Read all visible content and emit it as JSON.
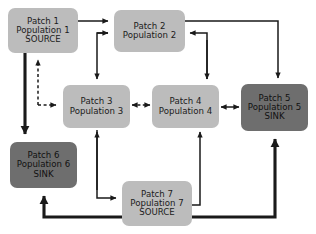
{
  "diagram": {
    "colors": {
      "source_and_neutral_fill": "#bcbcbc",
      "sink_fill": "#6e6e6e",
      "background": "#ffffff",
      "edge_color": "#1a1a1a",
      "text": "#1b1b1b"
    },
    "nodes": [
      {
        "id": "patch-1",
        "patch_label": "Patch 1",
        "population_label": "Population 1",
        "role_label": "SOURCE",
        "role": "source",
        "fill": "#bcbcbc",
        "x": 8,
        "y": 8,
        "w": 70,
        "h": 45
      },
      {
        "id": "patch-2",
        "patch_label": "Patch 2",
        "population_label": "Population 2",
        "role_label": "",
        "role": "neutral",
        "fill": "#bcbcbc",
        "x": 114,
        "y": 10,
        "w": 71,
        "h": 42
      },
      {
        "id": "patch-3",
        "patch_label": "Patch 3",
        "population_label": "Population 3",
        "role_label": "",
        "role": "neutral",
        "fill": "#bcbcbc",
        "x": 63,
        "y": 85,
        "w": 67,
        "h": 43
      },
      {
        "id": "patch-4",
        "patch_label": "Patch 4",
        "population_label": "Population 4",
        "role_label": "",
        "role": "neutral",
        "fill": "#bcbcbc",
        "x": 152,
        "y": 85,
        "w": 67,
        "h": 43
      },
      {
        "id": "patch-5",
        "patch_label": "Patch 5",
        "population_label": "Population 5",
        "role_label": "SINK",
        "role": "sink",
        "fill": "#6e6e6e",
        "x": 241,
        "y": 84,
        "w": 67,
        "h": 47
      },
      {
        "id": "patch-6",
        "patch_label": "Patch 6",
        "population_label": "Population 6",
        "role_label": "SINK",
        "role": "sink",
        "fill": "#6e6e6e",
        "x": 10,
        "y": 142,
        "w": 67,
        "h": 46
      },
      {
        "id": "patch-7",
        "patch_label": "Patch 7",
        "population_label": "Population 7",
        "role_label": "SOURCE",
        "role": "source",
        "fill": "#bcbcbc",
        "x": 122,
        "y": 181,
        "w": 70,
        "h": 45
      }
    ],
    "edges": [
      {
        "id": "e1",
        "from": "patch-1",
        "to": "patch-2",
        "style": "solid",
        "weight": "thin",
        "heads": "single"
      },
      {
        "id": "e2",
        "from": "patch-1",
        "to": "patch-6",
        "style": "solid",
        "weight": "thick",
        "heads": "single"
      },
      {
        "id": "e3",
        "from": "patch-6",
        "to": "patch-1",
        "style": "dashed",
        "weight": "thin",
        "heads": "single"
      },
      {
        "id": "e4",
        "from": "patch-6",
        "to": "patch-3",
        "style": "dashed",
        "weight": "thin",
        "heads": "single"
      },
      {
        "id": "e5",
        "from": "patch-2",
        "to": "patch-3",
        "style": "solid",
        "weight": "thin",
        "heads": "single"
      },
      {
        "id": "e6",
        "from": "patch-2",
        "to": "patch-5",
        "style": "solid",
        "weight": "thin",
        "heads": "single"
      },
      {
        "id": "e7",
        "from": "patch-4",
        "to": "patch-2",
        "style": "solid",
        "weight": "thin",
        "heads": "single"
      },
      {
        "id": "e8",
        "from": "patch-3",
        "to": "patch-4",
        "style": "dashed",
        "weight": "thin",
        "heads": "double"
      },
      {
        "id": "e9",
        "from": "patch-4",
        "to": "patch-5",
        "style": "solid",
        "weight": "thin",
        "heads": "double"
      },
      {
        "id": "e10",
        "from": "patch-3",
        "to": "patch-7",
        "style": "solid",
        "weight": "thin",
        "heads": "single"
      },
      {
        "id": "e11",
        "from": "patch-7",
        "to": "patch-3",
        "style": "solid",
        "weight": "thin",
        "heads": "single"
      },
      {
        "id": "e12",
        "from": "patch-7",
        "to": "patch-4",
        "style": "solid",
        "weight": "thin",
        "heads": "single"
      },
      {
        "id": "e13",
        "from": "patch-7",
        "to": "patch-5",
        "style": "solid",
        "weight": "thick",
        "heads": "single"
      },
      {
        "id": "e14",
        "from": "patch-7",
        "to": "patch-6",
        "style": "solid",
        "weight": "thick",
        "heads": "single"
      }
    ]
  }
}
